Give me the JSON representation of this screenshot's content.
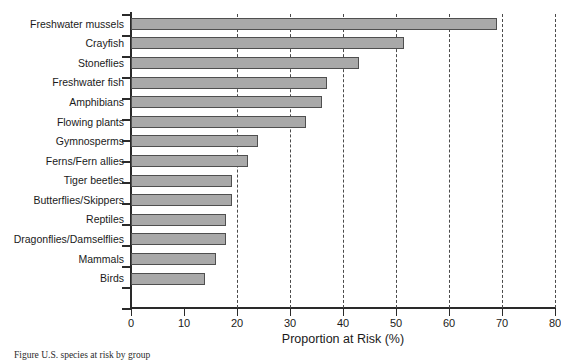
{
  "chart_data": {
    "type": "bar",
    "orientation": "horizontal",
    "title": "",
    "xlabel": "Proportion at Risk (%)",
    "ylabel": "",
    "xlim": [
      0,
      80
    ],
    "xticks": [
      0,
      10,
      20,
      30,
      40,
      50,
      60,
      70,
      80
    ],
    "grid": "vertical dashed gridlines at 20, 30, 40, 50, 60, 70, 80",
    "legend": "none",
    "categories": [
      "Freshwater mussels",
      "Crayfish",
      "Stoneflies",
      "Freshwater fish",
      "Amphibians",
      "Flowing plants",
      "Gymnosperms",
      "Ferns/Fern allies",
      "Tiger beetles",
      "Butterflies/Skippers",
      "Reptiles",
      "Dragonflies/Damselflies",
      "Mammals",
      "Birds"
    ],
    "values": [
      69,
      51.5,
      43,
      37,
      36,
      33,
      24,
      22,
      19,
      19,
      18,
      18,
      16,
      14
    ],
    "bar_color": "#a9a9a9",
    "bar_edge_color": "#4f4f4f",
    "axis_color": "#2a2a2a"
  },
  "axis": {
    "x_title": "Proportion at Risk (%)",
    "x_tick_labels": [
      "0",
      "10",
      "20",
      "30",
      "40",
      "50",
      "60",
      "70",
      "80"
    ]
  },
  "caption": {
    "text": "Figure  U.S. species at risk by group"
  }
}
